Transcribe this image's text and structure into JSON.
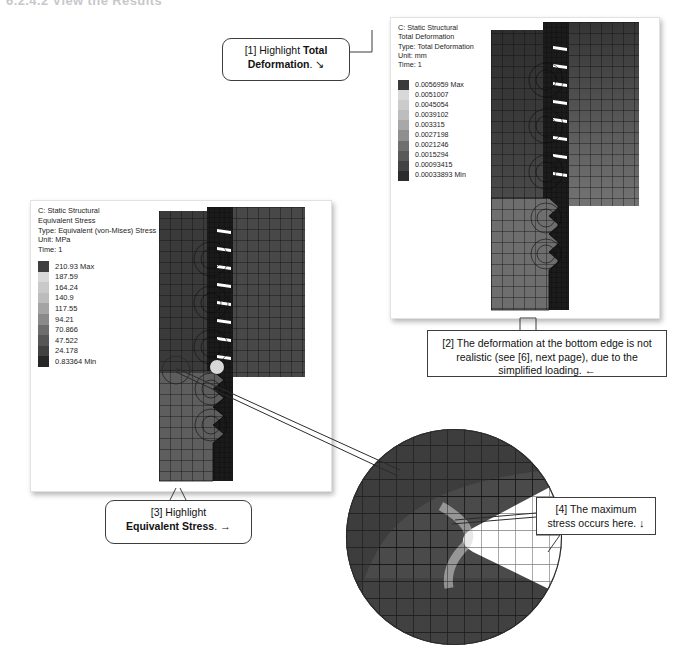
{
  "page": {
    "title": "6.2.4.2   View the Results"
  },
  "panels": {
    "deformation": {
      "name": "total-deformation-result",
      "header": [
        "C: Static Structural",
        "Total Deformation",
        "Type: Total Deformation",
        "Unit: mm",
        "Time: 1"
      ],
      "legend": [
        {
          "label": "0.0056959 Max",
          "color": "#3a3a3a"
        },
        {
          "label": "0.0051007",
          "color": "#d8d8d8"
        },
        {
          "label": "0.0045054",
          "color": "#cbcbcb"
        },
        {
          "label": "0.0039102",
          "color": "#bdbdbd"
        },
        {
          "label": "0.003315",
          "color": "#a8a8a8"
        },
        {
          "label": "0.0027198",
          "color": "#8f8f8f"
        },
        {
          "label": "0.0021246",
          "color": "#6f6f6f"
        },
        {
          "label": "0.0015294",
          "color": "#595959"
        },
        {
          "label": "0.00093415",
          "color": "#434343"
        },
        {
          "label": "0.00033893 Min",
          "color": "#2b2b2b"
        }
      ]
    },
    "stress": {
      "name": "equivalent-stress-result",
      "header": [
        "C: Static Structural",
        "Equivalent Stress",
        "Type: Equivalent (von-Mises) Stress",
        "Unit: MPa",
        "Time: 1"
      ],
      "legend": [
        {
          "label": "210.93 Max",
          "color": "#3f3f3f"
        },
        {
          "label": "187.59",
          "color": "#d9d9d9"
        },
        {
          "label": "164.24",
          "color": "#c9c9c9"
        },
        {
          "label": "140.9",
          "color": "#bcbcbc"
        },
        {
          "label": "117.55",
          "color": "#a4a4a4"
        },
        {
          "label": "94.21",
          "color": "#8a8a8a"
        },
        {
          "label": "70.866",
          "color": "#6d6d6d"
        },
        {
          "label": "47.522",
          "color": "#565656"
        },
        {
          "label": "24.178",
          "color": "#414141"
        },
        {
          "label": "0.83364 Min",
          "color": "#262626"
        }
      ]
    }
  },
  "callouts": {
    "c1": {
      "name": "callout-highlight-total-deformation",
      "prefix": "[1] Highlight ",
      "bold": "Total Deformation",
      "suffix": ".",
      "arrow": "↘"
    },
    "c2": {
      "name": "callout-deformation-not-realistic",
      "text": "[2] The deformation at the bottom edge is not realistic (see [6], next page), due to the simplified loading.",
      "arrow": "←"
    },
    "c3": {
      "name": "callout-highlight-equivalent-stress",
      "prefix": "[3] Highlight ",
      "bold": "Equivalent Stress",
      "suffix": ".",
      "arrow": "→"
    },
    "c4": {
      "name": "callout-maximum-stress-here",
      "text": "[4] The maximum stress occurs here.",
      "arrow": "↓"
    }
  },
  "detail": {
    "name": "zoom-detail-circle",
    "caption": ""
  }
}
